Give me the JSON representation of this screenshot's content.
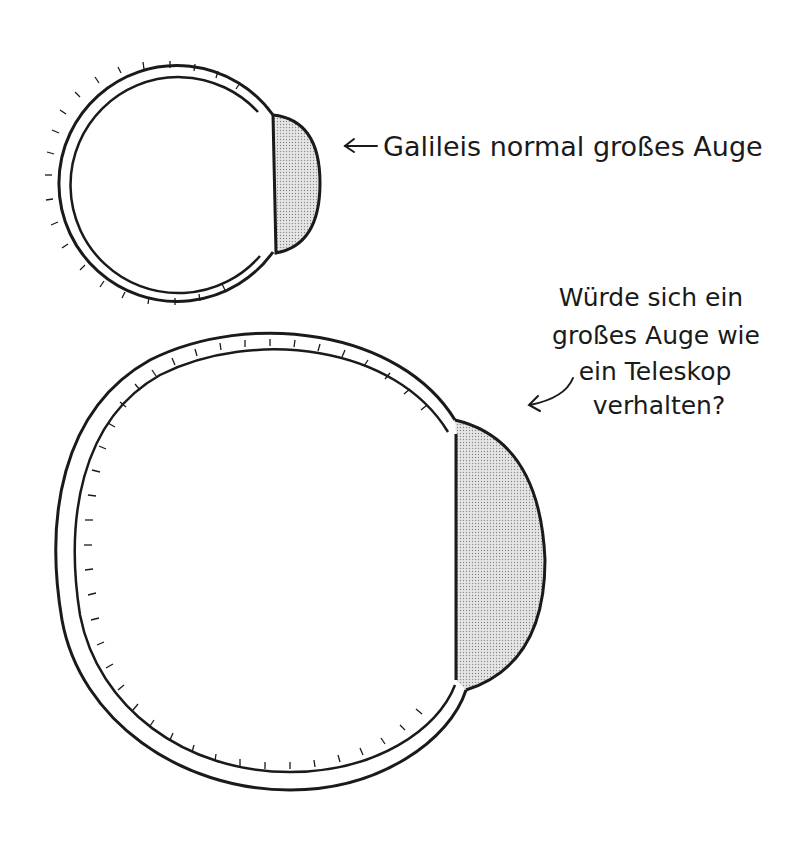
{
  "diagram": {
    "small_eye": {
      "label": "Galileis normal großes Auge"
    },
    "large_eye": {
      "question_lines": [
        "Würde sich ein",
        "großes Auge wie",
        "ein Teleskop",
        "verhalten?"
      ]
    },
    "colors": {
      "stroke": "#1a1a1a",
      "lens_fill": "#d4d4d4",
      "background": "#ffffff"
    }
  }
}
